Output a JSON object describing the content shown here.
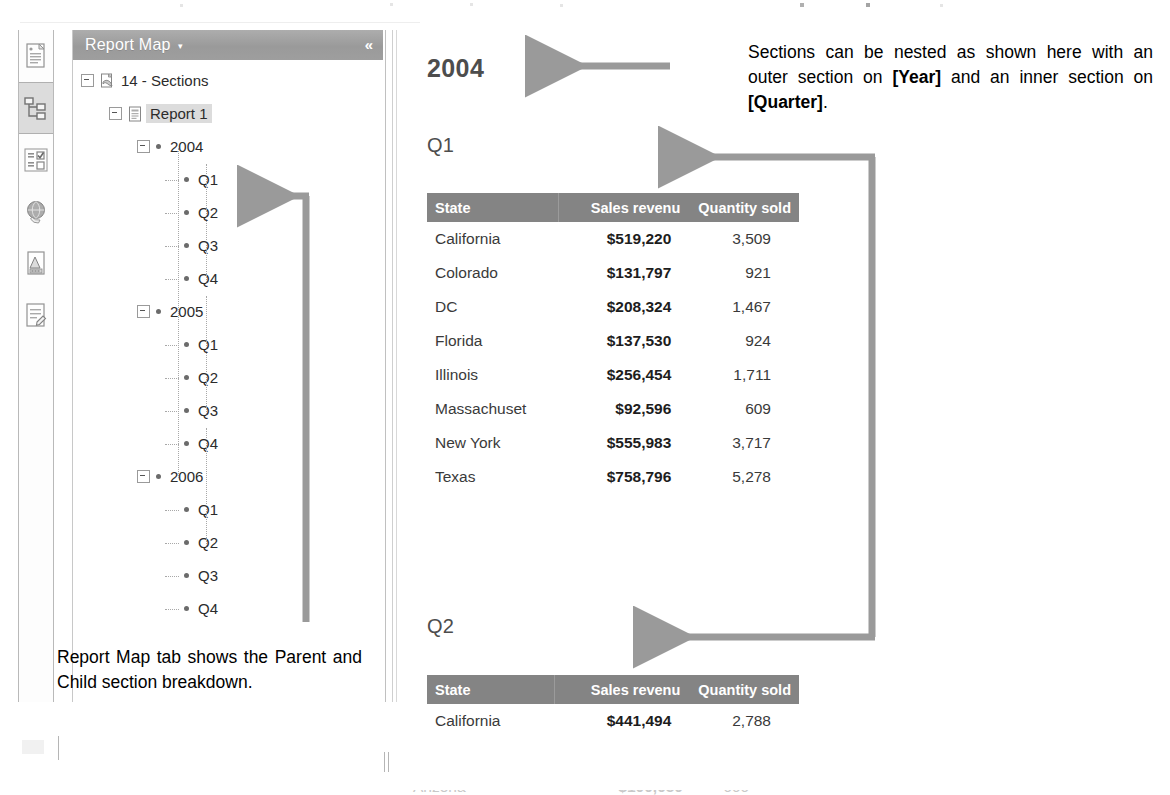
{
  "icon_rail": {
    "items": [
      {
        "name": "document-properties-icon",
        "active": false
      },
      {
        "name": "report-map-tree-icon",
        "active": true
      },
      {
        "name": "input-controls-icon",
        "active": false
      },
      {
        "name": "web-services-globe-icon",
        "active": false
      },
      {
        "name": "available-objects-icon",
        "active": false
      },
      {
        "name": "document-summary-icon",
        "active": false
      }
    ]
  },
  "panel": {
    "title": "Report Map",
    "caret": "▾",
    "collapse": "«"
  },
  "tree": {
    "nodes": [
      {
        "label": "14 - Sections",
        "depth": 0,
        "toggle": "minus",
        "icon": "document-icon",
        "selected": false
      },
      {
        "label": "Report 1",
        "depth": 1,
        "toggle": "minus",
        "icon": "report-icon",
        "selected": true
      },
      {
        "label": "2004",
        "depth": 2,
        "toggle": "minus",
        "icon": "bullet",
        "selected": false
      },
      {
        "label": "Q1",
        "depth": 3,
        "toggle": "none",
        "icon": "bullet",
        "selected": false
      },
      {
        "label": "Q2",
        "depth": 3,
        "toggle": "none",
        "icon": "bullet",
        "selected": false
      },
      {
        "label": "Q3",
        "depth": 3,
        "toggle": "none",
        "icon": "bullet",
        "selected": false
      },
      {
        "label": "Q4",
        "depth": 3,
        "toggle": "none",
        "icon": "bullet",
        "selected": false
      },
      {
        "label": "2005",
        "depth": 2,
        "toggle": "minus",
        "icon": "bullet",
        "selected": false
      },
      {
        "label": "Q1",
        "depth": 3,
        "toggle": "none",
        "icon": "bullet",
        "selected": false
      },
      {
        "label": "Q2",
        "depth": 3,
        "toggle": "none",
        "icon": "bullet",
        "selected": false
      },
      {
        "label": "Q3",
        "depth": 3,
        "toggle": "none",
        "icon": "bullet",
        "selected": false
      },
      {
        "label": "Q4",
        "depth": 3,
        "toggle": "none",
        "icon": "bullet",
        "selected": false
      },
      {
        "label": "2006",
        "depth": 2,
        "toggle": "minus",
        "icon": "bullet",
        "selected": false
      },
      {
        "label": "Q1",
        "depth": 3,
        "toggle": "none",
        "icon": "bullet",
        "selected": false
      },
      {
        "label": "Q2",
        "depth": 3,
        "toggle": "none",
        "icon": "bullet",
        "selected": false
      },
      {
        "label": "Q3",
        "depth": 3,
        "toggle": "none",
        "icon": "bullet",
        "selected": false
      },
      {
        "label": "Q4",
        "depth": 3,
        "toggle": "none",
        "icon": "bullet",
        "selected": false
      }
    ]
  },
  "report": {
    "year_title": "2004",
    "sections": [
      {
        "title": "Q1",
        "columns": [
          "State",
          "Sales revenu",
          "Quantity sold"
        ],
        "rows": [
          [
            "California",
            "$519,220",
            "3,509"
          ],
          [
            "Colorado",
            "$131,797",
            "921"
          ],
          [
            "DC",
            "$208,324",
            "1,467"
          ],
          [
            "Florida",
            "$137,530",
            "924"
          ],
          [
            "Illinois",
            "$256,454",
            "1,711"
          ],
          [
            "Massachuset",
            "$92,596",
            "609"
          ],
          [
            "New York",
            "$555,983",
            "3,717"
          ],
          [
            "Texas",
            "$758,796",
            "5,278"
          ]
        ]
      },
      {
        "title": "Q2",
        "columns": [
          "State",
          "Sales revenu",
          "Quantity sold"
        ],
        "rows": [
          [
            "California",
            "$441,494",
            "2,788"
          ]
        ]
      }
    ]
  },
  "annotations": {
    "top_line1": "Sections can be nested as shown",
    "top_line2_a": "here with an outer section on ",
    "top_line2_b": "[Year]",
    "top_line3_a": "and an inner section on ",
    "top_line3_b": "[Quarter]",
    "top_line3_c": ".",
    "bottom": "Report Map tab shows the Parent and Child section breakdown."
  },
  "colors": {
    "panel_header": "#9e9e9e",
    "table_header": "#848484",
    "arrow": "#9a9a9a",
    "selection": "#dcdcdc",
    "title_text": "#4d4d4d"
  }
}
